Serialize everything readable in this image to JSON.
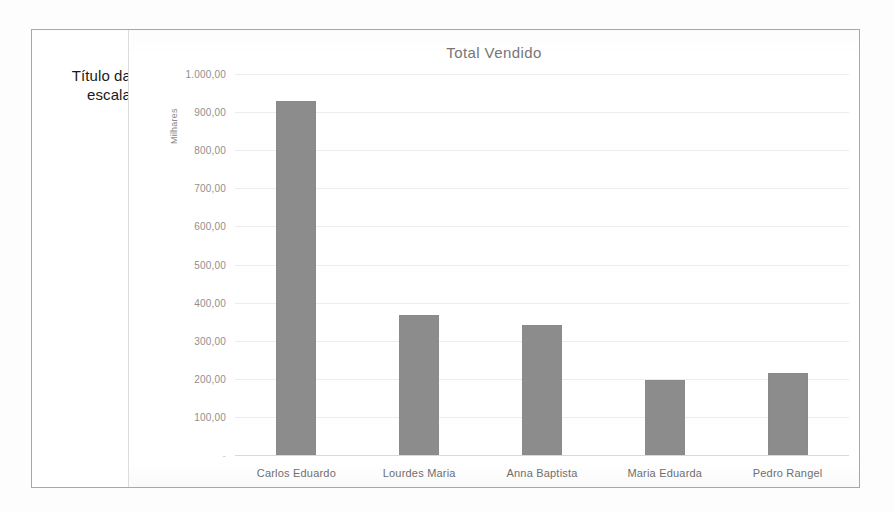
{
  "annotation": {
    "label": "Título da escala",
    "pointer_icon": "callout-pointer-icon"
  },
  "chart_data": {
    "type": "bar",
    "title": "Total Vendido",
    "xlabel": "",
    "ylabel": "Milhares",
    "categories": [
      "Carlos Eduardo",
      "Lourdes Maria",
      "Anna Baptista",
      "Maria Eduarda",
      "Pedro Rangel"
    ],
    "values": [
      928,
      367,
      340,
      197,
      215
    ],
    "ylim": [
      0,
      1000
    ],
    "ytick_values": [
      0,
      100,
      200,
      300,
      400,
      500,
      600,
      700,
      800,
      900,
      1000
    ],
    "ytick_labels": [
      "-",
      "100,00",
      "200,00",
      "300,00",
      "400,00",
      "500,00",
      "600,00",
      "700,00",
      "800,00",
      "900,00",
      "1.000,00"
    ],
    "grid": true,
    "legend": false,
    "bar_color": "#8c8c8c",
    "title_color": "#767676",
    "tick_color": "#8f8f8f",
    "gridline_color": "#ececec"
  }
}
